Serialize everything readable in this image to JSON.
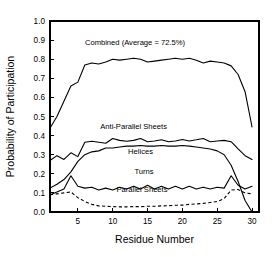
{
  "chart_data": {
    "type": "line",
    "title": "",
    "xlabel": "Residue Number",
    "ylabel": "Probability of Participation",
    "xlim": [
      1,
      31
    ],
    "ylim": [
      0.0,
      1.0
    ],
    "grid": false,
    "legend_position": "inline-annotations",
    "xticks": [
      5,
      10,
      15,
      20,
      25,
      30
    ],
    "xticklabels": [
      "5",
      "10",
      "15",
      "20",
      "25",
      "30"
    ],
    "yticks": [
      0.0,
      0.1,
      0.2,
      0.3,
      0.4,
      0.5,
      0.6,
      0.7,
      0.8,
      0.9,
      1.0
    ],
    "yticklabels": [
      "0.0",
      "0.1",
      "0.2",
      "0.3",
      "0.4",
      "0.5",
      "0.6",
      "0.7",
      "0.8",
      "0.9",
      "1.0"
    ],
    "x": [
      1,
      2,
      3,
      4,
      5,
      6,
      7,
      8,
      9,
      10,
      11,
      12,
      13,
      14,
      15,
      16,
      17,
      18,
      19,
      20,
      21,
      22,
      23,
      24,
      25,
      26,
      27,
      28,
      29,
      30
    ],
    "series": [
      {
        "name": "Combined (Average = 72.5%)",
        "label": "Combined (Average = 72.5%)",
        "style": "solid",
        "color": "#000000",
        "label_x": 13.2,
        "label_y": 0.875,
        "values": [
          0.44,
          0.5,
          0.58,
          0.66,
          0.68,
          0.77,
          0.78,
          0.775,
          0.785,
          0.8,
          0.795,
          0.8,
          0.805,
          0.8,
          0.785,
          0.79,
          0.795,
          0.8,
          0.805,
          0.8,
          0.805,
          0.795,
          0.78,
          0.79,
          0.785,
          0.78,
          0.765,
          0.72,
          0.63,
          0.445
        ]
      },
      {
        "name": "Anti-Parallel Sheets",
        "label": "Anti-Parallel Sheets",
        "style": "solid",
        "color": "#000000",
        "label_x": 13.0,
        "label_y": 0.435,
        "values": [
          0.27,
          0.295,
          0.275,
          0.31,
          0.29,
          0.365,
          0.37,
          0.365,
          0.36,
          0.385,
          0.375,
          0.37,
          0.375,
          0.385,
          0.368,
          0.372,
          0.378,
          0.368,
          0.372,
          0.38,
          0.372,
          0.378,
          0.385,
          0.368,
          0.372,
          0.375,
          0.368,
          0.33,
          0.295,
          0.275
        ]
      },
      {
        "name": "Helices",
        "label": "Helices",
        "style": "solid",
        "color": "#000000",
        "label_x": 14.0,
        "label_y": 0.305,
        "values": [
          0.125,
          0.145,
          0.17,
          0.21,
          0.265,
          0.3,
          0.315,
          0.32,
          0.335,
          0.335,
          0.34,
          0.345,
          0.345,
          0.348,
          0.345,
          0.345,
          0.348,
          0.345,
          0.345,
          0.348,
          0.345,
          0.34,
          0.335,
          0.33,
          0.32,
          0.3,
          0.245,
          0.16,
          0.06,
          0.0
        ]
      },
      {
        "name": "Turns",
        "label": "Turns",
        "style": "solid",
        "color": "#000000",
        "label_x": 14.5,
        "label_y": 0.2,
        "values": [
          0.09,
          0.105,
          0.12,
          0.19,
          0.135,
          0.125,
          0.13,
          0.115,
          0.125,
          0.115,
          0.13,
          0.12,
          0.135,
          0.12,
          0.14,
          0.12,
          0.135,
          0.12,
          0.135,
          0.12,
          0.135,
          0.12,
          0.13,
          0.12,
          0.13,
          0.125,
          0.19,
          0.14,
          0.12,
          0.135
        ]
      },
      {
        "name": "Parallel Sheets",
        "label": "Parallel Sheets",
        "style": "dashed",
        "color": "#000000",
        "label_x": 14.2,
        "label_y": 0.105,
        "values": [
          0.09,
          0.095,
          0.1,
          0.105,
          0.075,
          0.055,
          0.04,
          0.032,
          0.03,
          0.028,
          0.027,
          0.027,
          0.028,
          0.028,
          0.03,
          0.03,
          0.032,
          0.033,
          0.035,
          0.036,
          0.04,
          0.042,
          0.045,
          0.05,
          0.055,
          0.07,
          0.115,
          0.118,
          0.1,
          0.095
        ]
      }
    ]
  }
}
